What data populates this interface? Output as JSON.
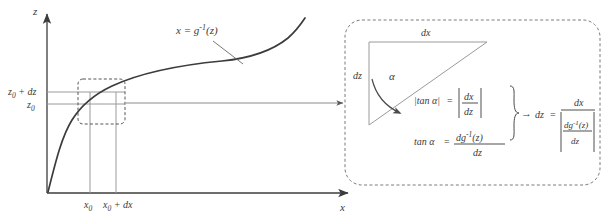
{
  "figure": {
    "left_panel": {
      "axis_z_label": "z",
      "axis_x_label": "x",
      "curve_label": "x = g",
      "curve_label_sup": "-1",
      "curve_label_arg": "(z)",
      "y_ticks": [
        {
          "label": "z",
          "sub": "0",
          "suffix": " + dz"
        },
        {
          "label": "z",
          "sub": "0",
          "suffix": ""
        }
      ],
      "x_ticks": [
        {
          "label": "x",
          "sub": "0",
          "suffix": ""
        },
        {
          "label": "x",
          "sub": "0",
          "suffix": " + dx"
        }
      ],
      "zoom_box_name": "magnified-region"
    },
    "right_panel": {
      "triangle": {
        "top_label": "dx",
        "left_label": "dz",
        "angle_label": "α"
      },
      "eq1": {
        "lhs": "|tan α|",
        "eq": "=",
        "num": "dx",
        "den": "dz"
      },
      "eq2": {
        "lhs": "tan α",
        "eq": "=",
        "num": "dg",
        "num_sup": "-1",
        "num_arg": "(z)",
        "den": "dz"
      },
      "implies": "→",
      "result": {
        "lhs": "dz",
        "eq": "=",
        "num": "dx",
        "den_num": "dg",
        "den_num_sup": "-1",
        "den_num_arg": "(z)",
        "den_den": "dz"
      }
    },
    "colors": {
      "curve": "#3c3c3c",
      "axis": "#3c3c3c",
      "guide": "#9a9a9a",
      "dashed": "#7a7a7a",
      "text": "#3a3a3a",
      "triangle": "#9a9a9a",
      "background": "#ffffff"
    }
  }
}
